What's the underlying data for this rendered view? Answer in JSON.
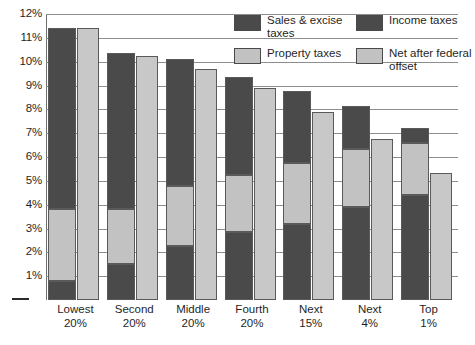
{
  "chart_data": {
    "type": "bar",
    "title": "",
    "xlabel": "",
    "ylabel": "",
    "ylim": [
      0,
      12
    ],
    "ytick_labels": [
      "12%",
      "11%",
      "10%",
      "9%",
      "8%",
      "7%",
      "6%",
      "5%",
      "4%",
      "3%",
      "2%",
      "1%"
    ],
    "ytick_values": [
      12,
      11,
      10,
      9,
      8,
      7,
      6,
      5,
      4,
      3,
      2,
      1
    ],
    "zero_tick_mark": "—",
    "grid": true,
    "legend_position": "top-right",
    "categories": [
      "Lowest 20%",
      "Second 20%",
      "Middle 20%",
      "Fourth 20%",
      "Next 15%",
      "Next 4%",
      "Top 1%"
    ],
    "category_lines": [
      [
        "Lowest",
        "20%"
      ],
      [
        "Second",
        "20%"
      ],
      [
        "Middle",
        "20%"
      ],
      [
        "Fourth",
        "20%"
      ],
      [
        "Next",
        "15%"
      ],
      [
        "Next",
        "4%"
      ],
      [
        "Top",
        "1%"
      ]
    ],
    "series": [
      {
        "name": "Sales & excise taxes",
        "stack": "total",
        "color": "#4a4a4a",
        "values": [
          0.8,
          1.5,
          2.25,
          2.85,
          3.2,
          3.9,
          4.4
        ]
      },
      {
        "name": "Property taxes",
        "stack": "total",
        "color": "#c2c2c2",
        "values": [
          3.0,
          2.3,
          2.55,
          2.4,
          2.55,
          2.45,
          2.2
        ]
      },
      {
        "name": "Income taxes",
        "stack": "total",
        "color": "#4a4a4a",
        "values": [
          7.6,
          6.55,
          5.3,
          4.1,
          3.0,
          1.8,
          0.6
        ]
      },
      {
        "name": "Net after federal offset",
        "stack": "net",
        "color": "#c8c8c8",
        "values": [
          11.4,
          10.25,
          9.7,
          8.9,
          7.9,
          6.75,
          5.35
        ]
      }
    ],
    "totals": [
      11.4,
      10.35,
      10.1,
      9.35,
      8.75,
      8.15,
      7.2
    ]
  },
  "legend": {
    "items": [
      {
        "label": "Sales & excise taxes",
        "swatch": "dark"
      },
      {
        "label": "Income taxes",
        "swatch": "dark"
      },
      {
        "label": "Property taxes",
        "swatch": "light"
      },
      {
        "label": "Net after federal offset",
        "swatch": "light"
      }
    ]
  },
  "colors": {
    "dark": "#4a4a4a",
    "light": "#c2c2c2",
    "net": "#c8c8c8",
    "grid": "#8e8e8e",
    "text": "#1f1f1f",
    "background": "#ffffff"
  }
}
